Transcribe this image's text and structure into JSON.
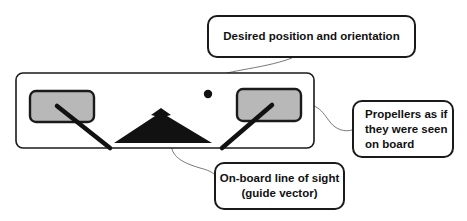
{
  "diagram": {
    "callouts": {
      "desired": {
        "label": "Desired position and orientation"
      },
      "propellers": {
        "lines": [
          "Propellers as if",
          "they were seen",
          "on board"
        ]
      },
      "line_of_sight": {
        "lines": [
          "On-board line of sight",
          "(guide vector)"
        ]
      }
    },
    "elements": {
      "frame": "view frame",
      "left_propeller": "left propeller",
      "right_propeller": "right propeller",
      "guide_vector": "guide vector triangle",
      "target_dot": "desired position marker"
    },
    "colors": {
      "stroke": "#1a1a1a",
      "propeller_fill": "#b8b8b8",
      "fill_dark": "#111111"
    }
  }
}
